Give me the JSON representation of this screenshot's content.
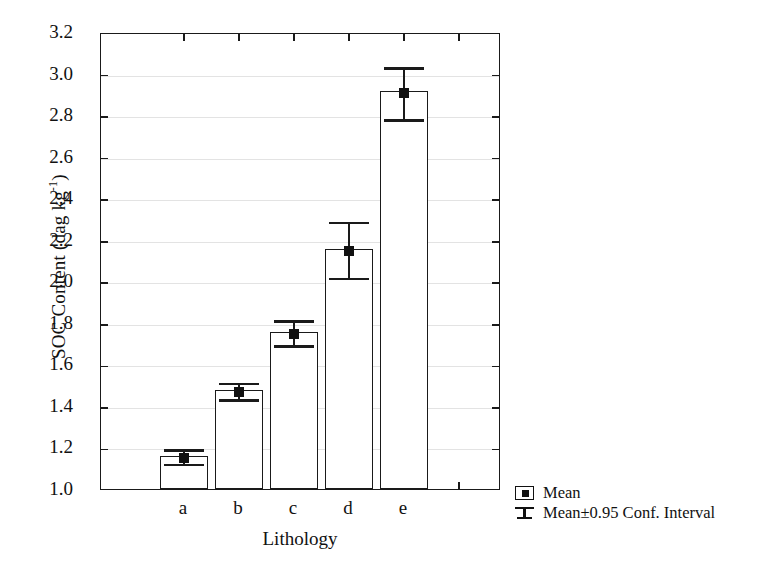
{
  "chart_data": {
    "type": "bar",
    "title": "",
    "xlabel": "Lithology",
    "ylabel": "SOC Content (dag kg",
    "ylabel_exponent": "-1",
    "ylabel_tail": ")",
    "categories": [
      "a",
      "b",
      "c",
      "d",
      "e"
    ],
    "values": [
      1.16,
      1.475,
      1.755,
      2.155,
      2.915
    ],
    "error_low": [
      1.125,
      1.435,
      1.695,
      2.02,
      2.785
    ],
    "error_high": [
      1.195,
      1.515,
      1.815,
      2.29,
      3.035
    ],
    "ylim": [
      1.0,
      3.2
    ],
    "ytick_labels": [
      "3.2",
      "3.0",
      "2.8",
      "2.6",
      "2.4",
      "2.2",
      "2.0",
      "1.8",
      "1.6",
      "1.4",
      "1.2",
      "1.0"
    ],
    "yticks": [
      3.2,
      3.0,
      2.8,
      2.6,
      2.4,
      2.2,
      2.0,
      1.8,
      1.6,
      1.4,
      1.2,
      1.0
    ],
    "grid": true,
    "legend_position": "bottom-right",
    "legend": [
      {
        "marker": "mean-square-icon",
        "label": "Mean"
      },
      {
        "marker": "error-bar-icon",
        "label": "Mean±0.95 Conf. Interval"
      }
    ]
  }
}
